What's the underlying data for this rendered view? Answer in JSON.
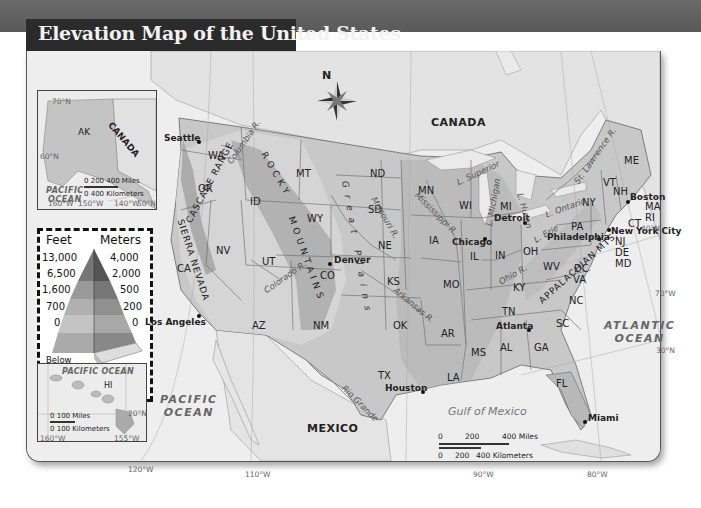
{
  "title": "Elevation Map of the United States",
  "compass": {
    "label": "N"
  },
  "countries": [
    "CANADA",
    "MEXICO"
  ],
  "oceans": {
    "pacific": "PACIFIC OCEAN",
    "atlantic": "ATLANTIC OCEAN",
    "gulf": "Gulf of Mexico"
  },
  "states": [
    "WA",
    "OR",
    "CA",
    "ID",
    "NV",
    "MT",
    "WY",
    "UT",
    "AZ",
    "CO",
    "NM",
    "ND",
    "SD",
    "NE",
    "KS",
    "OK",
    "TX",
    "MN",
    "IA",
    "MO",
    "AR",
    "LA",
    "WI",
    "IL",
    "MI",
    "IN",
    "OH",
    "KY",
    "TN",
    "MS",
    "AL",
    "GA",
    "FL",
    "SC",
    "NC",
    "VA",
    "WV",
    "PA",
    "NY",
    "VT",
    "NH",
    "ME",
    "MA",
    "RI",
    "CT",
    "NJ",
    "DE",
    "MD",
    "DC"
  ],
  "cities": [
    "Seattle",
    "Los Angeles",
    "Denver",
    "Chicago",
    "Detroit",
    "Houston",
    "Atlanta",
    "Miami",
    "Philadelphia",
    "New York City",
    "Boston"
  ],
  "mountains": {
    "cascade": "CASCADE RANGE",
    "sierra": "SIERRA NEVADA",
    "rocky_1": "ROCKY",
    "rocky_2": "MOUNTAINS",
    "great_plains": "Great Plains",
    "appalachian": "APPALACHIAN MTS."
  },
  "rivers": {
    "columbia": "Columbia R.",
    "colorado": "Colorado R.",
    "missouri": "Missouri R.",
    "mississippi": "Mississippi R.",
    "arkansas": "Arkansas R.",
    "ohio": "Ohio R.",
    "rio_grande": "Rio Grande",
    "st_lawrence": "St. Lawrence R."
  },
  "lakes": {
    "superior": "L. Superior",
    "michigan": "L. Michigan",
    "huron": "L. Huron",
    "erie": "L. Erie",
    "ontario": "L. Ontario"
  },
  "gridlines": {
    "lon": [
      "120°W",
      "110°W",
      "90°W",
      "80°W",
      "70°W"
    ],
    "lat": [
      "40°N",
      "30°N"
    ]
  },
  "alaska_inset": {
    "state": "AK",
    "country": "CANADA",
    "ocean_line1": "PACIFIC",
    "ocean_line2": "OCEAN",
    "lat": [
      "70°N",
      "60°N",
      "50°N"
    ],
    "lon": [
      "160°W",
      "150°W",
      "140°W"
    ],
    "scale_miles": "0   200   400 Miles",
    "scale_km": "0    400 Kilometers"
  },
  "hawaii_inset": {
    "state": "HI",
    "ocean": "PACIFIC OCEAN",
    "lat": "20°N",
    "lon": [
      "160°W",
      "155°W"
    ],
    "scale_miles": "0       100 Miles",
    "scale_km": "0   100 Kilometers"
  },
  "main_scale": {
    "miles": [
      "0",
      "200",
      "400 Miles"
    ],
    "km": [
      "0",
      "200",
      "400 Kilometers"
    ]
  },
  "legend": {
    "feet_header": "Feet",
    "meters_header": "Meters",
    "feet": [
      "13,000",
      "6,500",
      "1,600",
      "700",
      "0"
    ],
    "meters": [
      "4,000",
      "2,000",
      "500",
      "200",
      "0"
    ],
    "below_1": "Below",
    "below_2": "Sea Level"
  }
}
